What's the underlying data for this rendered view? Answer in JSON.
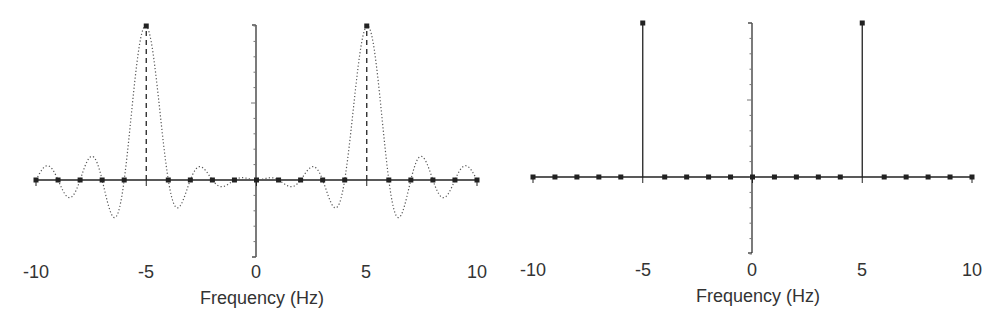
{
  "chart_data": [
    {
      "id": "left",
      "type": "line",
      "title": "",
      "xlabel": "Frequency (Hz)",
      "ylabel": "",
      "xlim": [
        -10,
        10
      ],
      "ylim": [
        -0.5,
        1.0
      ],
      "x_ticks": [
        -10,
        -5,
        0,
        5,
        10
      ],
      "x_tick_labels": [
        "-10",
        "-5",
        "0",
        "5",
        "10"
      ],
      "y_tick_labels": [],
      "grid": false,
      "legend": null,
      "description": "Continuous spectrum (dotted) of a finite-length sinusoid showing sinc-shaped main lobes at ±5 Hz with sidelobes; dashed stems at ±5 Hz; DFT samples (dots) at integer frequencies lying on zero crossings.",
      "continuous_series": {
        "name": "continuous spectrum",
        "style": "dotted",
        "formula": "sinc(f-5) + sinc(f+5), sinc(x)=sin(pi x)/(pi x)",
        "x": [
          -10,
          -9.5,
          -9,
          -8.5,
          -8,
          -7.5,
          -7,
          -6.5,
          -6,
          -5.5,
          -5,
          -4.5,
          -4,
          -3.5,
          -3,
          -2.5,
          -2,
          -1.5,
          -1,
          -0.5,
          0,
          0.5,
          1,
          1.5,
          2,
          2.5,
          3,
          3.5,
          4,
          4.5,
          5,
          5.5,
          6,
          6.5,
          7,
          7.5,
          8,
          8.5,
          9,
          9.5,
          10
        ],
        "y": [
          0,
          0.1,
          0,
          -0.09,
          0,
          0.14,
          0,
          -0.22,
          0,
          0.64,
          1.0,
          0.64,
          0,
          -0.22,
          0,
          0.14,
          0,
          -0.09,
          0,
          0.06,
          0,
          0.06,
          0,
          -0.09,
          0,
          0.14,
          0,
          -0.22,
          0,
          0.64,
          1.0,
          0.64,
          0,
          -0.22,
          0,
          0.14,
          0,
          -0.09,
          0,
          0.1,
          0
        ]
      },
      "stem_series": {
        "name": "DFT samples",
        "style": "dashed stems with square markers",
        "x": [
          -10,
          -9,
          -8,
          -7,
          -6,
          -5,
          -4,
          -3,
          -2,
          -1,
          0,
          1,
          2,
          3,
          4,
          5,
          6,
          7,
          8,
          9,
          10
        ],
        "y": [
          0,
          0,
          0,
          0,
          0,
          1,
          0,
          0,
          0,
          0,
          0,
          0,
          0,
          0,
          0,
          1,
          0,
          0,
          0,
          0,
          0
        ]
      }
    },
    {
      "id": "right",
      "type": "bar",
      "title": "",
      "xlabel": "Frequency (Hz)",
      "ylabel": "",
      "xlim": [
        -10,
        10
      ],
      "ylim": [
        -0.5,
        1.0
      ],
      "x_ticks": [
        -10,
        -5,
        0,
        5,
        10
      ],
      "x_tick_labels": [
        "-10",
        "-5",
        "0",
        "5",
        "10"
      ],
      "y_tick_labels": [],
      "grid": false,
      "legend": null,
      "description": "Stem plot of DFT samples: unit impulses at ±5 Hz, zero elsewhere.",
      "stem_series": {
        "name": "DFT samples",
        "style": "solid stems with square markers",
        "x": [
          -10,
          -9,
          -8,
          -7,
          -6,
          -5,
          -4,
          -3,
          -2,
          -1,
          0,
          1,
          2,
          3,
          4,
          5,
          6,
          7,
          8,
          9,
          10
        ],
        "y": [
          0,
          0,
          0,
          0,
          0,
          1,
          0,
          0,
          0,
          0,
          0,
          0,
          0,
          0,
          0,
          1,
          0,
          0,
          0,
          0,
          0
        ]
      }
    }
  ],
  "panels": {
    "left": {
      "xlabel": "Frequency (Hz)",
      "tick_labels": [
        "-10",
        "-5",
        "0",
        "5",
        "10"
      ],
      "geom": {
        "x0": 36,
        "x1": 477,
        "zero_y": 180,
        "peak_y": 26,
        "yaxis_x": 256,
        "yaxis_top": 25,
        "yaxis_bottom": 257
      }
    },
    "right": {
      "xlabel": "Frequency (Hz)",
      "tick_labels": [
        "-10",
        "-5",
        "0",
        "5",
        "10"
      ],
      "geom": {
        "x0": 33,
        "x1": 472,
        "zero_y": 177,
        "peak_y": 23,
        "yaxis_x": 252,
        "yaxis_top": 23,
        "yaxis_bottom": 253
      }
    }
  },
  "colors": {
    "ink": "#222222",
    "curve": "#555555",
    "text": "#333333"
  }
}
